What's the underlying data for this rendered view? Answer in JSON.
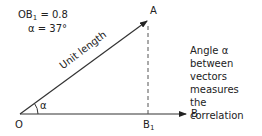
{
  "formula": {
    "ob1_label": "OB",
    "ob1_sub": "1",
    "ob1_value": "= 0.8",
    "alpha_label": "α = 37°"
  },
  "points": {
    "origin": "O",
    "a": "A",
    "b": "B",
    "b1": "B",
    "b1_sub": "1"
  },
  "vector_label": "Unit length",
  "angle_label": "α",
  "caption": {
    "line1": "Angle α between",
    "line2": "vectors measures",
    "line3": "the correlation"
  },
  "colors": {
    "line": "#333333",
    "text": "#222222"
  }
}
